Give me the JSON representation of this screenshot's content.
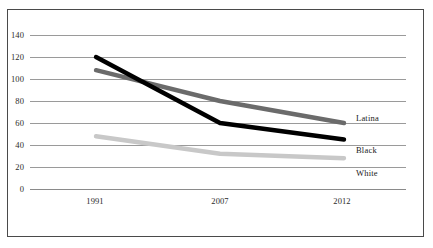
{
  "chart_data": {
    "type": "line",
    "title": "",
    "subtitle": "",
    "xlabel": "",
    "ylabel": "",
    "x": [
      "1991",
      "2007",
      "2012"
    ],
    "categories": [
      "1991",
      "2007",
      "2012"
    ],
    "ylim": [
      0,
      140
    ],
    "yticks": [
      "0",
      "20",
      "40",
      "60",
      "80",
      "100",
      "120",
      "140"
    ],
    "grid": true,
    "legend_position": "right-inline",
    "series": [
      {
        "name": "Latina",
        "color": "#6b6b6b",
        "values": [
          108,
          80,
          60
        ]
      },
      {
        "name": "Black",
        "color": "#000000",
        "values": [
          120,
          60,
          45
        ]
      },
      {
        "name": "White",
        "color": "#c8c8c8",
        "values": [
          48,
          32,
          28
        ]
      }
    ],
    "annotations": []
  },
  "axes": {
    "y_ticks": [
      {
        "label": "140",
        "value": 140
      },
      {
        "label": "120",
        "value": 120
      },
      {
        "label": "100",
        "value": 100
      },
      {
        "label": "80",
        "value": 80
      },
      {
        "label": "60",
        "value": 60
      },
      {
        "label": "40",
        "value": 40
      },
      {
        "label": "20",
        "value": 20
      },
      {
        "label": "0",
        "value": 0
      }
    ],
    "x_ticks": [
      {
        "label": "1991"
      },
      {
        "label": "2007"
      },
      {
        "label": "2012"
      }
    ]
  },
  "series_labels": [
    {
      "label": "Latina"
    },
    {
      "label": "Black"
    },
    {
      "label": "White"
    }
  ],
  "colors": {
    "latina": "#6b6b6b",
    "black": "#000000",
    "white": "#c8c8c8",
    "gridline": "#9a9a9a",
    "frame": "#4a4a4a",
    "text": "#2b2b2b",
    "background": "#ffffff"
  }
}
